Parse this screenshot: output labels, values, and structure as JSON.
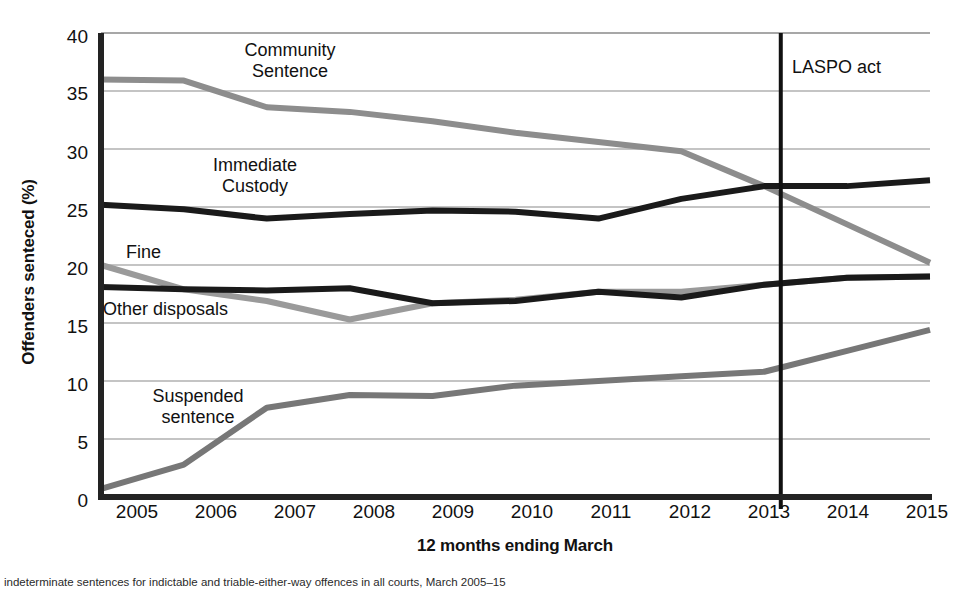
{
  "chart_data": {
    "type": "line",
    "title": "",
    "xlabel": "12 months ending March",
    "ylabel": "Offenders senteced (%)",
    "categories": [
      2005,
      2006,
      2007,
      2008,
      2009,
      2010,
      2011,
      2012,
      2013,
      2014,
      2015
    ],
    "xlim": [
      2005,
      2015
    ],
    "ylim": [
      0,
      40
    ],
    "yticks": [
      0,
      5,
      10,
      15,
      20,
      25,
      30,
      35,
      40
    ],
    "xticks": [
      "2005",
      "2006",
      "2007",
      "2008",
      "2009",
      "2010",
      "2011",
      "2012",
      "2013",
      "2014",
      "2015"
    ],
    "grid": "horizontal",
    "legend": "inline-labels",
    "series": [
      {
        "name": "Community Sentence",
        "color": "#8d8d8d",
        "values": [
          36.0,
          35.9,
          33.6,
          33.2,
          32.4,
          31.4,
          30.6,
          29.8,
          26.8,
          23.5,
          20.2
        ]
      },
      {
        "name": "Immediate Custody",
        "color": "#1a1a1a",
        "values": [
          25.2,
          24.8,
          24.0,
          24.4,
          24.7,
          24.6,
          24.0,
          25.7,
          26.8,
          26.8,
          27.3
        ]
      },
      {
        "name": "Fine",
        "color": "#9a9a9a",
        "values": [
          20.0,
          17.9,
          16.9,
          15.3,
          16.7,
          17.0,
          17.7,
          17.7,
          18.3,
          18.9,
          19.0
        ]
      },
      {
        "name": "Other disposals",
        "color": "#1a1a1a",
        "values": [
          18.1,
          17.9,
          17.8,
          18.0,
          16.7,
          16.9,
          17.7,
          17.2,
          18.3,
          18.9,
          19.0
        ]
      },
      {
        "name": "Suspended sentence",
        "color": "#777777",
        "values": [
          0.7,
          2.8,
          7.7,
          8.8,
          8.7,
          9.6,
          10.0,
          10.4,
          10.8,
          12.6,
          14.4
        ]
      }
    ],
    "annotations": [
      {
        "name": "laspo-act",
        "label": "LASPO act",
        "type": "vertical-line",
        "x": 2013.2
      }
    ],
    "series_labels": [
      {
        "name": "community-sentence",
        "line1": "Community",
        "line2": "Sentence"
      },
      {
        "name": "immediate-custody",
        "line1": "Immediate",
        "line2": "Custody"
      },
      {
        "name": "fine",
        "line1": "Fine",
        "line2": ""
      },
      {
        "name": "other-disposals",
        "line1": "Other disposals",
        "line2": ""
      },
      {
        "name": "suspended-sentence",
        "line1": "Suspended",
        "line2": "sentence"
      }
    ]
  },
  "caption": "indeterminate sentences for indictable and triable-either-way offences in all courts, March 2005–15"
}
